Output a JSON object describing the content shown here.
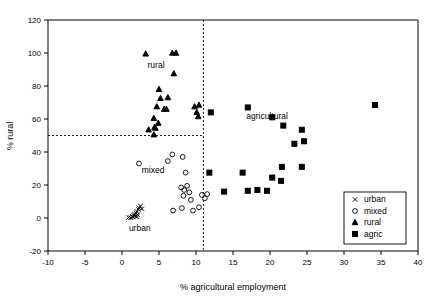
{
  "figure": {
    "type": "scatter-plot",
    "background": "#ffffff",
    "foreground": "#000000"
  },
  "chart_data": {
    "type": "scatter",
    "title": "",
    "xlabel": "% agricultural employment",
    "ylabel": "% rural",
    "xlim": [
      -10,
      40
    ],
    "ylim": [
      -20,
      120
    ],
    "xticks": [
      -10,
      -5,
      0,
      5,
      10,
      15,
      20,
      25,
      30,
      35,
      40
    ],
    "xticklabels": [
      "-10",
      "-5",
      "0",
      "5",
      "10",
      "15",
      "20",
      "25",
      "30",
      "35",
      "40"
    ],
    "yticks": [
      -20,
      0,
      20,
      40,
      60,
      80,
      100,
      120
    ],
    "yticklabels": [
      "-20",
      "0",
      "20",
      "40",
      "60",
      "80",
      "100",
      "120"
    ],
    "grid": false,
    "legend_position": "bottom-right",
    "reference_lines": [
      {
        "name": "vertical-threshold",
        "orientation": "vertical",
        "value": 11.0,
        "style": "dashed"
      },
      {
        "name": "horizontal-threshold",
        "orientation": "horizontal",
        "value": 50.0,
        "style": "dashed"
      }
    ],
    "annotations": [
      {
        "text": "rural",
        "x": 4.6,
        "y": 91
      },
      {
        "text": "agricultural",
        "x": 19.6,
        "y": 60
      },
      {
        "text": "mixed",
        "x": 4.2,
        "y": 27
      },
      {
        "text": "urban",
        "x": 2.4,
        "y": -8
      }
    ],
    "series": [
      {
        "name": "urban",
        "marker": "x",
        "color": "#000000",
        "points": [
          [
            0.9,
            0.4
          ],
          [
            1.2,
            0.2
          ],
          [
            1.5,
            0.6
          ],
          [
            1.6,
            1.6
          ],
          [
            1.7,
            2.3
          ],
          [
            1.8,
            1.1
          ],
          [
            1.9,
            3.0
          ],
          [
            2.0,
            4.0
          ],
          [
            2.1,
            2.0
          ],
          [
            2.2,
            5.2
          ],
          [
            2.3,
            6.2
          ],
          [
            2.5,
            7.2
          ],
          [
            2.7,
            5.6
          ],
          [
            1.4,
            0.9
          ],
          [
            2.0,
            0.8
          ]
        ]
      },
      {
        "name": "mixed",
        "marker": "o",
        "color": "#000000",
        "points": [
          [
            2.3,
            33.0
          ],
          [
            6.2,
            34.5
          ],
          [
            6.8,
            38.5
          ],
          [
            8.2,
            37.0
          ],
          [
            8.6,
            27.5
          ],
          [
            8.0,
            18.5
          ],
          [
            8.4,
            17.0
          ],
          [
            8.3,
            13.5
          ],
          [
            8.8,
            19.5
          ],
          [
            9.1,
            15.5
          ],
          [
            9.3,
            11.0
          ],
          [
            9.6,
            4.5
          ],
          [
            10.4,
            6.5
          ],
          [
            10.8,
            14.0
          ],
          [
            11.2,
            12.0
          ],
          [
            11.5,
            14.5
          ],
          [
            6.9,
            4.5
          ],
          [
            8.1,
            6.0
          ]
        ]
      },
      {
        "name": "rural",
        "marker": "^",
        "color": "#000000",
        "points": [
          [
            3.2,
            99.5
          ],
          [
            6.8,
            100.0
          ],
          [
            7.3,
            100.0
          ],
          [
            7.0,
            87.5
          ],
          [
            5.0,
            78.0
          ],
          [
            5.2,
            72.5
          ],
          [
            4.7,
            67.5
          ],
          [
            4.3,
            60.5
          ],
          [
            4.9,
            57.5
          ],
          [
            5.7,
            66.0
          ],
          [
            6.2,
            73.0
          ],
          [
            6.0,
            66.0
          ],
          [
            3.6,
            53.5
          ],
          [
            4.4,
            55.0
          ],
          [
            4.5,
            54.5
          ],
          [
            4.3,
            50.5
          ],
          [
            9.8,
            67.5
          ],
          [
            10.1,
            64.0
          ],
          [
            10.4,
            68.5
          ],
          [
            10.3,
            61.5
          ]
        ]
      },
      {
        "name": "agric",
        "marker": "s",
        "color": "#000000",
        "points": [
          [
            12.0,
            64.0
          ],
          [
            17.0,
            67.0
          ],
          [
            20.3,
            61.0
          ],
          [
            21.8,
            56.0
          ],
          [
            24.3,
            53.5
          ],
          [
            34.2,
            68.5
          ],
          [
            23.3,
            45.0
          ],
          [
            24.6,
            46.5
          ],
          [
            16.3,
            27.5
          ],
          [
            11.8,
            27.5
          ],
          [
            17.0,
            16.5
          ],
          [
            18.3,
            17.0
          ],
          [
            19.6,
            16.5
          ],
          [
            20.3,
            24.5
          ],
          [
            21.6,
            31.0
          ],
          [
            24.3,
            31.0
          ],
          [
            13.8,
            16.0
          ],
          [
            21.5,
            22.5
          ]
        ]
      }
    ]
  },
  "legend": {
    "entries": [
      {
        "symbol": "×",
        "label": "urban",
        "marker": "x"
      },
      {
        "symbol": "○",
        "label": "mixed",
        "marker": "o"
      },
      {
        "symbol": "▲",
        "label": "rural",
        "marker": "^"
      },
      {
        "symbol": "■",
        "label": "agric",
        "marker": "s"
      }
    ]
  }
}
